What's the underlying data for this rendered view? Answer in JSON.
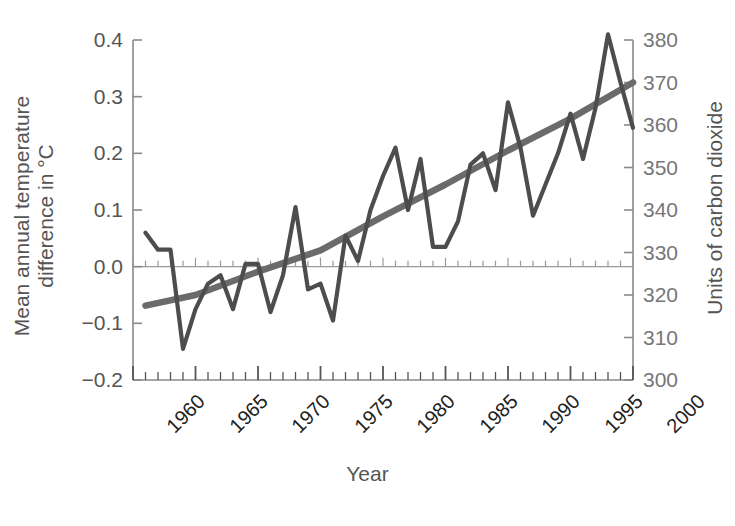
{
  "chart_data": {
    "type": "line",
    "title": "",
    "xlabel": "Year",
    "ylabel_left": "Mean annual temperature\ndifference in °C",
    "ylabel_left_line1": "Mean annual temperature",
    "ylabel_left_line2": "difference in °C",
    "ylabel_right": "Units of carbon dioxide",
    "xlim": [
      1960,
      2000
    ],
    "ylim_left": [
      -0.2,
      0.4
    ],
    "ylim_right": [
      300,
      380
    ],
    "grid": false,
    "legend": "none",
    "x_major_tick_labels": [
      "1960",
      "1965",
      "1970",
      "1975",
      "1980",
      "1985",
      "1990",
      "1995",
      "2000"
    ],
    "x_major_ticks": [
      1960,
      1965,
      1970,
      1975,
      1980,
      1985,
      1990,
      1995,
      2000
    ],
    "x_minor_tick_step": 1,
    "y_left_tick_labels": [
      "0.4",
      "0.3",
      "0.2",
      "0.1",
      "0.0",
      "−0.1",
      "−0.2"
    ],
    "y_left_ticks": [
      0.4,
      0.3,
      0.2,
      0.1,
      0.0,
      -0.1,
      -0.2
    ],
    "y_right_tick_labels": [
      "380",
      "370",
      "360",
      "350",
      "340",
      "330",
      "320",
      "310",
      "300"
    ],
    "y_right_ticks": [
      380,
      370,
      360,
      350,
      340,
      330,
      320,
      310,
      300
    ],
    "colors": {
      "temperature_line": "#4d4d4d",
      "co2_line": "#6b6b6b",
      "axis": "#8a8a8a",
      "zero_line": "#9a9a9a",
      "text_left": "#555555",
      "text_right": "#777777",
      "xtick_text": "#222222"
    },
    "series": [
      {
        "name": "Mean annual temperature difference",
        "axis": "left",
        "units": "°C",
        "x": [
          1961,
          1962,
          1963,
          1964,
          1965,
          1966,
          1967,
          1968,
          1969,
          1970,
          1971,
          1972,
          1973,
          1974,
          1975,
          1976,
          1977,
          1978,
          1979,
          1980,
          1981,
          1982,
          1983,
          1984,
          1985,
          1986,
          1987,
          1988,
          1989,
          1990,
          1991,
          1992,
          1993,
          1994,
          1995,
          1996,
          1997,
          1998,
          1999,
          2000
        ],
        "values": [
          0.06,
          0.03,
          0.03,
          -0.145,
          -0.075,
          -0.03,
          -0.015,
          -0.075,
          0.005,
          0.005,
          -0.08,
          -0.015,
          0.105,
          -0.04,
          -0.03,
          -0.095,
          0.055,
          0.01,
          0.1,
          0.16,
          0.21,
          0.1,
          0.19,
          0.035,
          0.035,
          0.08,
          0.18,
          0.2,
          0.135,
          0.29,
          0.21,
          0.09,
          0.145,
          0.2,
          0.27,
          0.19,
          0.28,
          0.41,
          0.325,
          0.245
        ]
      },
      {
        "name": "Units of carbon dioxide",
        "axis": "right",
        "units": "ppm",
        "x": [
          1961,
          1965,
          1970,
          1975,
          1980,
          1985,
          1990,
          1995,
          2000
        ],
        "values": [
          317.5,
          320.0,
          325.5,
          330.5,
          338.5,
          346.0,
          354.0,
          361.5,
          370.0
        ]
      }
    ]
  }
}
